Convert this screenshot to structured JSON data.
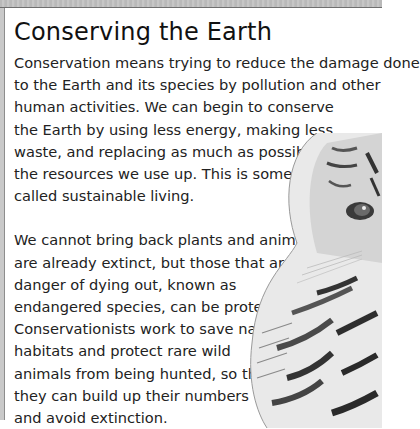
{
  "title": "Conserving the Earth",
  "paragraphs": [
    {
      "lines": [
        "Conservation means trying to reduce the damage done",
        "to the Earth and its species by pollution and other",
        "human activities. We can begin to conserve",
        "the Earth by using less energy, making less",
        "waste, and replacing as much as possible of",
        "the resources we use up. This is sometimes",
        "called sustainable living."
      ]
    },
    {
      "lines": [
        "We cannot bring back plants and animals that",
        "are already extinct, but those that are in",
        "danger of dying out, known as",
        "endangered species, can be protected.",
        "Conservationists work to save natural",
        "habitats and protect rare wild",
        "animals from being hunted, so that",
        "they can build up their numbers",
        "and avoid extinction."
      ]
    }
  ],
  "image": {
    "subject": "tiger-illustration",
    "style": "grayscale"
  }
}
